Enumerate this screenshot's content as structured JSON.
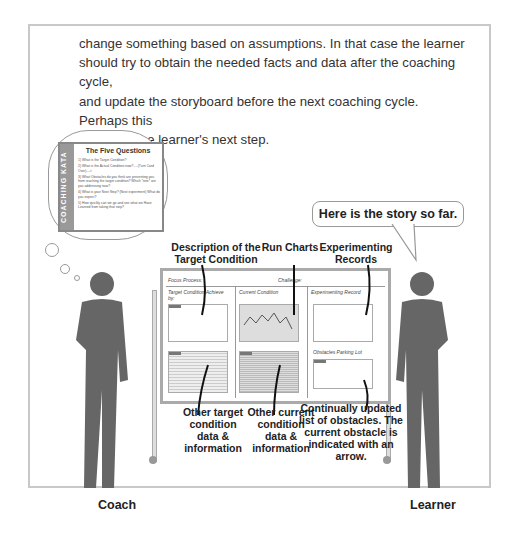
{
  "paragraph": {
    "lines": [
      "change something based on assumptions. In that case the learner",
      "should try to obtain the needed facts and data after the coaching cycle,",
      "and update the storyboard before the next coaching cycle. Perhaps this",
      "becomes the learner's next step."
    ]
  },
  "coaching_kata_card": {
    "side_label": "COACHING KATA",
    "title": "The Five Questions",
    "questions": [
      "1) What is the Target Condition?",
      "2) What is the Actual Condition now? ---(Turn Card Over)--->",
      "3) What Obstacles do you think are preventing you from reaching the target condition? Which *one* are you addressing now?",
      "4) What is your Next Step? (Next experiment) What do you expect?",
      "5) How quickly can we go and see what we Have Learned from taking that step?"
    ]
  },
  "speech_bubble": "Here is the story so far.",
  "callouts": {
    "target_description": "Description of the Target Condition",
    "run_charts": "Run Charts",
    "experimenting_records": "Experimenting Records",
    "other_target": "Other target condition data & information",
    "other_current": "Other current condition data & information",
    "obstacles": "Continually updated list of obstacles. The current obstacle is indicated with an arrow."
  },
  "storyboard": {
    "focus_process": "Focus Process:",
    "challenge": "Challenge:",
    "col1": "Target Condition Achieve by:",
    "col2": "Current Condition",
    "col3": "Experimenting Record",
    "parking_lot": "Obstacles Parking Lot"
  },
  "people": {
    "left": "Coach",
    "right": "Learner"
  }
}
